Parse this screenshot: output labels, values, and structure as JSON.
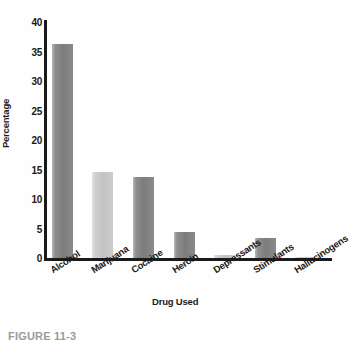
{
  "chart_data": {
    "type": "bar",
    "title": "",
    "xlabel": "Drug Used",
    "ylabel": "Percentage",
    "categories": [
      "Alcohol",
      "Marijuana",
      "Cocaine",
      "Heroin",
      "Depressants",
      "Stimulants",
      "Hallucinogens"
    ],
    "values": [
      36.2,
      14.6,
      13.7,
      4.4,
      0.5,
      3.4,
      0.2
    ],
    "ylim": [
      0,
      40
    ],
    "yticks": [
      0,
      5,
      10,
      15,
      20,
      25,
      30,
      35,
      40
    ],
    "ytick_labels": [
      "0",
      "5",
      "10",
      "15",
      "20",
      "25",
      "30",
      "35",
      "40"
    ],
    "grid": false,
    "legend": "none",
    "bar_shades": [
      "dark",
      "light",
      "dark",
      "dark",
      "light",
      "dark",
      "light"
    ],
    "colors": {
      "bar_dark": "#7c7c7c",
      "bar_light": "#c2c2c2",
      "axis": "#1a1a1a",
      "background": "#fefefe",
      "text": "#1a1a1a"
    }
  },
  "caption": {
    "text": "FIGURE 11-3"
  }
}
